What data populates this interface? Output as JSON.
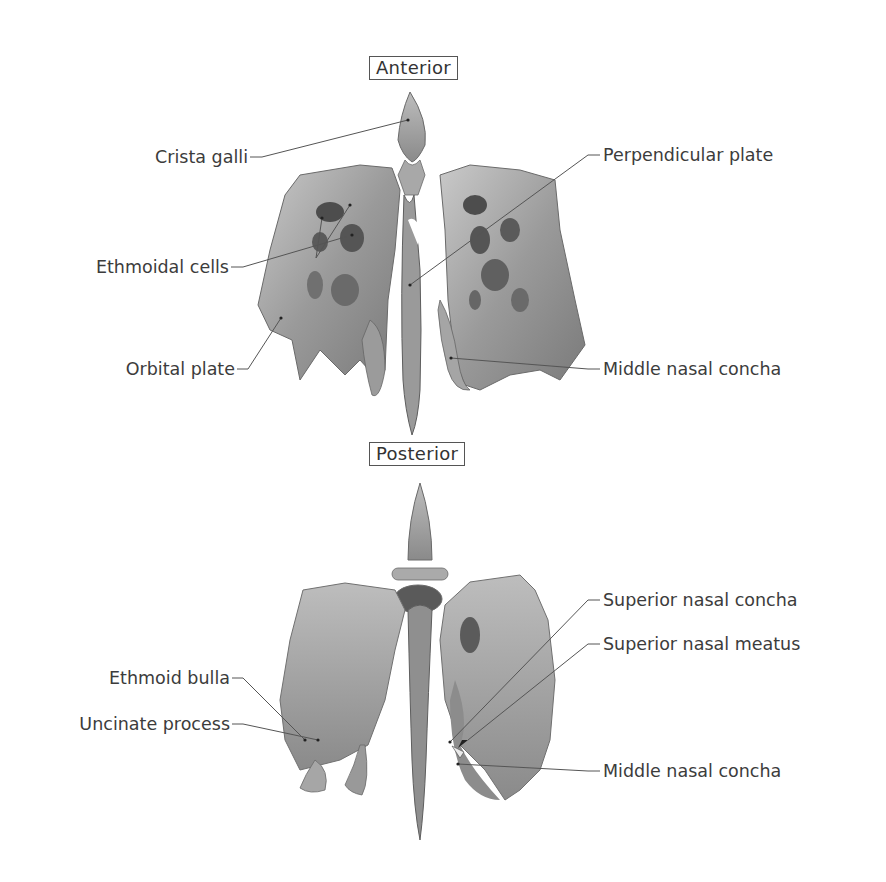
{
  "figure": {
    "views": [
      {
        "id": "anterior",
        "tag": "Anterior",
        "labels_left": [
          "Crista galli",
          "Ethmoidal cells",
          "Orbital plate"
        ],
        "labels_right": [
          "Perpendicular plate",
          "Middle nasal concha"
        ]
      },
      {
        "id": "posterior",
        "tag": "Posterior",
        "labels_left": [
          "Ethmoid bulla",
          "Uncinate process"
        ],
        "labels_right": [
          "Superior nasal concha",
          "Superior nasal meatus",
          "Middle nasal concha"
        ]
      }
    ]
  },
  "colors": {
    "background": "#ffffff",
    "text": "#3c3c3c",
    "leader_line": "#555555",
    "bone_light": "#b8b8b8",
    "bone_mid": "#8f8f8f",
    "bone_dark": "#4a4a4a"
  }
}
